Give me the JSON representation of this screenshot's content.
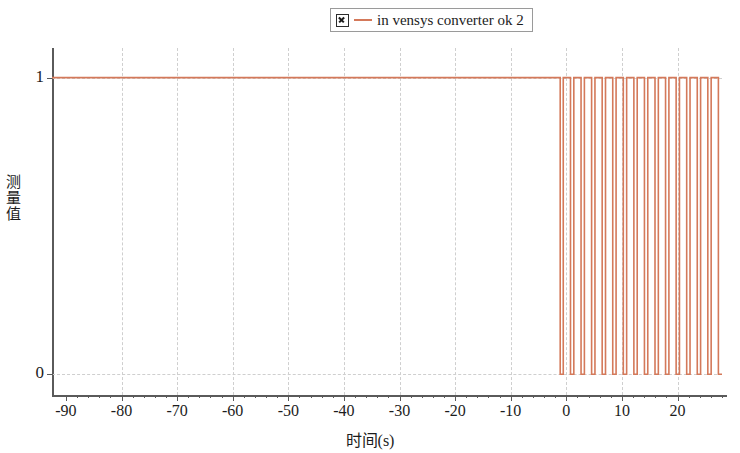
{
  "legend": {
    "checkbox_icon": "checked-box-icon",
    "line_icon": "line-swatch-icon",
    "label": "in vensys converter ok 2",
    "color": "#d4795a"
  },
  "axes": {
    "xlabel": "时间(s)",
    "ylabel_chars": [
      "测",
      "量",
      "值"
    ],
    "ylabel": "测量值",
    "x_ticks": [
      -90,
      -80,
      -70,
      -60,
      -50,
      -40,
      -30,
      -20,
      -10,
      0,
      10,
      20
    ],
    "x_tick_labels": [
      "-90",
      "-80",
      "-70",
      "-60",
      "-50",
      "-40",
      "-30",
      "-20",
      "-10",
      "0",
      "10",
      "20"
    ],
    "y_ticks": [
      0,
      1
    ],
    "y_tick_labels": [
      "0",
      "1"
    ]
  },
  "chart_data": {
    "type": "line",
    "title": "",
    "xlabel": "时间(s)",
    "ylabel": "测量值",
    "xlim": [
      -92.5,
      28.0
    ],
    "ylim": [
      -0.07,
      1.1
    ],
    "grid": true,
    "legend_position": "top-center",
    "series": [
      {
        "name": "in vensys converter ok 2",
        "color": "#d4795a",
        "style": "step",
        "x": [
          -92.5,
          -1.1,
          -1.1,
          -0.55,
          -0.55,
          0.75,
          0.75,
          1.35,
          1.35,
          2.65,
          2.65,
          3.25,
          3.25,
          4.55,
          4.55,
          5.15,
          5.15,
          6.45,
          6.45,
          7.05,
          7.05,
          8.35,
          8.35,
          8.95,
          8.95,
          10.25,
          10.25,
          10.85,
          10.85,
          12.15,
          12.15,
          12.75,
          12.75,
          14.05,
          14.05,
          14.65,
          14.65,
          15.95,
          15.95,
          16.55,
          16.55,
          17.85,
          17.85,
          18.45,
          18.45,
          19.75,
          19.75,
          20.35,
          20.35,
          21.65,
          21.65,
          22.25,
          22.25,
          23.55,
          23.55,
          24.15,
          24.15,
          25.45,
          25.45,
          26.05,
          26.05,
          27.35,
          27.35,
          28.0
        ],
        "y": [
          1,
          1,
          0,
          0,
          1,
          1,
          0,
          0,
          1,
          1,
          0,
          0,
          1,
          1,
          0,
          0,
          1,
          1,
          0,
          0,
          1,
          1,
          0,
          0,
          1,
          1,
          0,
          0,
          1,
          1,
          0,
          0,
          1,
          1,
          0,
          0,
          1,
          1,
          0,
          0,
          1,
          1,
          0,
          0,
          1,
          1,
          0,
          0,
          1,
          1,
          0,
          0,
          1,
          1,
          0,
          0,
          1,
          1,
          0,
          0,
          1,
          1,
          0,
          0
        ]
      }
    ],
    "annotations": [
      "Signal holds constant at 1 from -90 s until approximately -1 s",
      "Square-wave pulsing between 1 and 0 from about 0 s to 28 s"
    ]
  }
}
